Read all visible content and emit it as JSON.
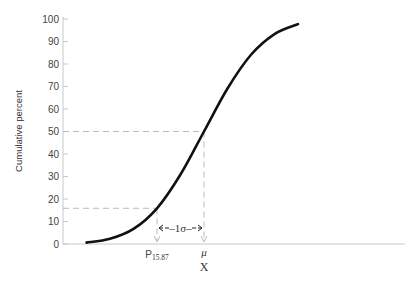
{
  "chart_data": {
    "type": "line",
    "title": "",
    "xlabel": "X",
    "ylabel": "Cumulative percent",
    "ylim": [
      0,
      100
    ],
    "yticks": [
      0,
      10,
      20,
      30,
      40,
      50,
      60,
      70,
      80,
      90,
      100
    ],
    "ytick_labels": [
      "0",
      "10",
      "20",
      "30",
      "40",
      "50",
      "60",
      "70",
      "80",
      "90",
      "100"
    ],
    "grid": false,
    "legend": "none",
    "x_units": "standard deviations from the mean (σ)",
    "xlim_sigma": [
      -3.0,
      3.0
    ],
    "series": [
      {
        "name": "cumulative normal",
        "color": "#111111",
        "x_sigma": [
          -2.5,
          -2.0,
          -1.5,
          -1.0,
          -0.5,
          0.0,
          0.5,
          1.0,
          1.5,
          2.0
        ],
        "y": [
          0.6,
          2.3,
          6.7,
          15.87,
          30.9,
          50.0,
          69.1,
          84.1,
          93.3,
          97.7
        ]
      }
    ],
    "reference_lines": [
      {
        "name": "mean",
        "y": 50.0,
        "x_sigma": 0.0,
        "color": "#bbbbbb",
        "style": "dashed"
      },
      {
        "name": "p15.87",
        "y": 15.87,
        "x_sigma": -1.0,
        "color": "#bbbbbb",
        "style": "dashed"
      }
    ],
    "annotations": {
      "p_label_main": "P",
      "p_label_sub": "15.87",
      "mu_label": "μ",
      "sigma_label": "1σ"
    }
  }
}
